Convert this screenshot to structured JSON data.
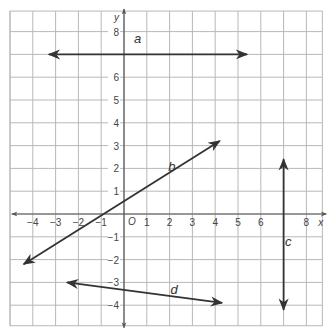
{
  "chart_data": {
    "type": "coordinate-grid",
    "title": "",
    "xlabel": "x",
    "ylabel": "y",
    "origin_label": "O",
    "xlim": [
      -5,
      8.7
    ],
    "ylim": [
      -4.9,
      8.9
    ],
    "grid": true,
    "x_ticks": [
      -4,
      -3,
      -2,
      -1,
      1,
      2,
      3,
      4,
      5,
      6,
      8
    ],
    "y_ticks": [
      8,
      6,
      5,
      4,
      3,
      2,
      1,
      -1,
      -2,
      -3,
      -4
    ],
    "lines": [
      {
        "name": "a",
        "type": "horizontal",
        "from": [
          -3.3,
          7
        ],
        "to": [
          5.4,
          7
        ],
        "label_pos": [
          0.6,
          7.5
        ]
      },
      {
        "name": "b",
        "type": "slanted",
        "from": [
          -4.4,
          -2.2
        ],
        "to": [
          4.2,
          3.2
        ],
        "label_pos": [
          2.1,
          1.9
        ]
      },
      {
        "name": "c",
        "type": "vertical",
        "from": [
          7,
          2.4
        ],
        "to": [
          7,
          -4.2
        ],
        "label_pos": [
          7.2,
          -1.4
        ]
      },
      {
        "name": "d",
        "type": "slanted",
        "from": [
          -2.5,
          -3
        ],
        "to": [
          4.3,
          -3.9
        ],
        "label_pos": [
          2.2,
          -3.5
        ]
      }
    ]
  },
  "colors": {
    "grid": "#b8b8b8",
    "axis": "#555555",
    "line": "#333333",
    "text": "#444444"
  }
}
